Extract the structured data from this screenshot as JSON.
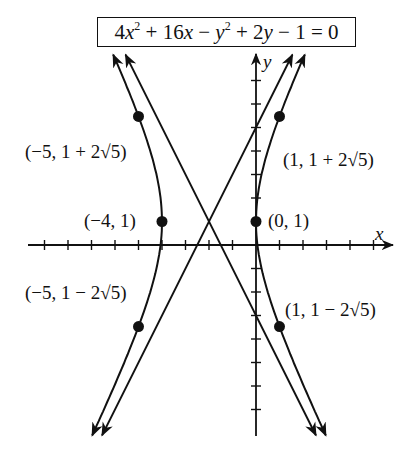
{
  "equation": {
    "text": "4x² + 16x − y² + 2y − 1 = 0",
    "parts": [
      "4",
      "x",
      "2",
      " + 16",
      "x",
      " − ",
      "y",
      "2",
      " + 2",
      "y",
      " − 1 = 0"
    ]
  },
  "axes": {
    "x_label": "x",
    "y_label": "y",
    "x_range": [
      -10,
      6
    ],
    "y_range": [
      -8,
      8
    ],
    "tick_spacing": 1
  },
  "points": [
    {
      "id": "vertex-left",
      "label": "(−4, 1)",
      "x": -4,
      "y": 1
    },
    {
      "id": "vertex-right",
      "label": "(0, 1)",
      "x": 0,
      "y": 1
    },
    {
      "id": "upper-left",
      "label": "(−5, 1 + 2√5)",
      "x": -5,
      "y": 5.472
    },
    {
      "id": "upper-right",
      "label": "(1, 1 + 2√5)",
      "x": 1,
      "y": 5.472
    },
    {
      "id": "lower-left",
      "label": "(−5, 1 − 2√5)",
      "x": -5,
      "y": -3.472
    },
    {
      "id": "lower-right",
      "label": "(1, 1 − 2√5)",
      "x": 1,
      "y": -3.472
    }
  ],
  "hyperbola": {
    "center": [
      -2,
      1
    ],
    "a": 2,
    "b": 4,
    "orientation": "horizontal",
    "asymptotes": [
      "y − 1 = 2(x + 2)",
      "y − 1 = −2(x + 2)"
    ]
  },
  "colors": {
    "ink": "#111111",
    "background": "#ffffff"
  }
}
